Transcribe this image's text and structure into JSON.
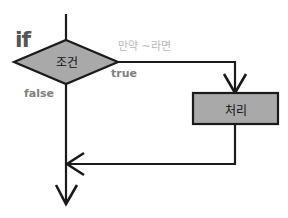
{
  "diagram": {
    "title": "if",
    "condition_label": "조건",
    "annotation": "만약 ~라면",
    "true_label": "true",
    "false_label": "false",
    "process_label": "처리",
    "colors": {
      "shape_fill": "#a9a9a9",
      "stroke": "#1a1a1a",
      "keyword": "#555555",
      "branch_label": "#808080",
      "annotation": "#b8b8b8"
    }
  }
}
